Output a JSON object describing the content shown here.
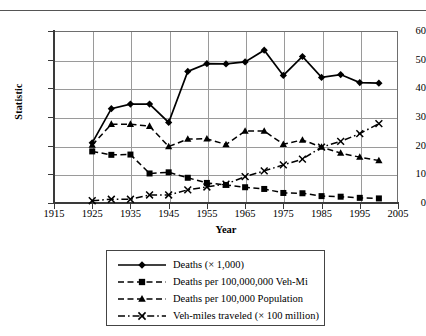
{
  "chart_data": {
    "type": "line",
    "title": "",
    "xlabel": "Year",
    "ylabel": "Statistic",
    "xlim": [
      1915,
      2005
    ],
    "ylim": [
      0,
      60
    ],
    "xticks": [
      1915,
      1925,
      1935,
      1945,
      1955,
      1965,
      1975,
      1985,
      1995,
      2005
    ],
    "yticks": [
      0,
      10,
      20,
      30,
      40,
      50,
      60
    ],
    "grid": true,
    "legend_position": "below-axes",
    "x": [
      1925,
      1930,
      1935,
      1940,
      1945,
      1950,
      1955,
      1960,
      1965,
      1970,
      1975,
      1980,
      1985,
      1990,
      1995,
      2000
    ],
    "series": [
      {
        "name": "Deaths (× 1,000)",
        "marker": "diamond",
        "linestyle": "solid",
        "color": "#000000",
        "values": [
          21.0,
          32.9,
          34.5,
          34.5,
          28.1,
          45.9,
          48.6,
          48.5,
          49.2,
          53.3,
          44.5,
          51.1,
          43.8,
          44.8,
          42.0,
          41.8
        ]
      },
      {
        "name": "Deaths per 100,000,000 Veh-Mi",
        "marker": "square",
        "linestyle": "dashed",
        "color": "#000000",
        "values": [
          18.0,
          16.8,
          16.9,
          10.3,
          10.7,
          8.8,
          7.0,
          6.3,
          5.5,
          4.9,
          3.5,
          3.4,
          2.4,
          2.2,
          1.8,
          1.6
        ]
      },
      {
        "name": "Deaths per 100,000 Population",
        "marker": "triangle",
        "linestyle": "dashed",
        "color": "#000000",
        "values": [
          20.2,
          27.5,
          27.5,
          26.8,
          19.7,
          22.3,
          22.4,
          20.4,
          25.1,
          25.1,
          20.5,
          22.0,
          19.5,
          17.4,
          16.0,
          14.8
        ]
      },
      {
        "name": "Veh-miles traveled (× 100 million)",
        "marker": "x",
        "linestyle": "dashdot",
        "color": "#000000",
        "values": [
          0.8,
          1.3,
          1.3,
          2.8,
          2.8,
          4.6,
          5.6,
          6.6,
          9.2,
          11.2,
          13.3,
          15.3,
          19.5,
          21.5,
          24.2,
          27.7
        ]
      }
    ]
  },
  "axes": {
    "ylabel_title": "Statistic",
    "xlabel_title": "Year",
    "ytick_labels": [
      "60",
      "50",
      "40",
      "30",
      "20",
      "10",
      "0"
    ],
    "xtick_labels": [
      "1915",
      "1925",
      "1935",
      "1945",
      "1955",
      "1965",
      "1975",
      "1985",
      "1995",
      "2005"
    ]
  },
  "legend": {
    "entries": [
      {
        "label": "Deaths (× 1,000)",
        "marker": "diamond",
        "linestyle": "solid"
      },
      {
        "label": "Deaths per 100,000,000 Veh-Mi",
        "marker": "square",
        "linestyle": "dashed"
      },
      {
        "label": "Deaths per 100,000 Population",
        "marker": "triangle",
        "linestyle": "dashed"
      },
      {
        "label": "Veh-miles traveled (× 100 million)",
        "marker": "x",
        "linestyle": "dashdot"
      }
    ]
  }
}
